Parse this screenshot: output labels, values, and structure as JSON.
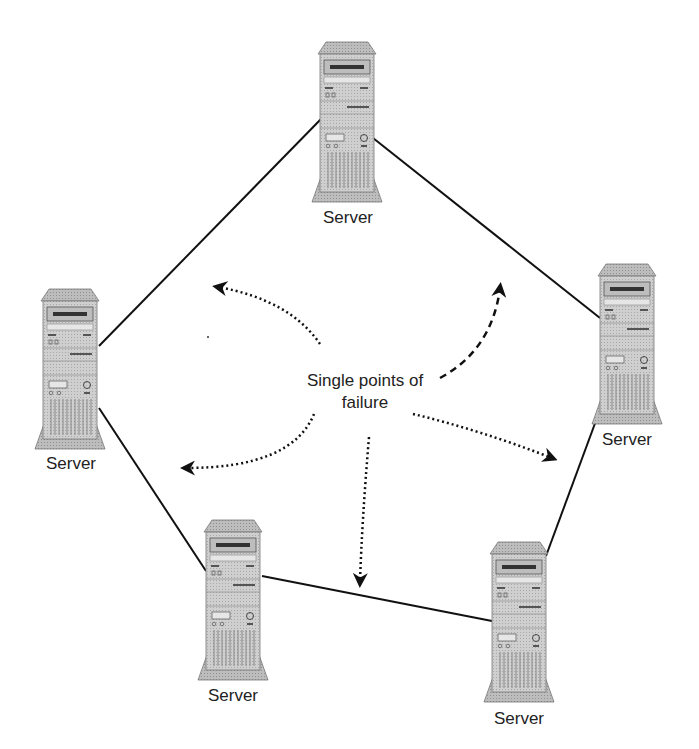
{
  "center_label": {
    "line1": "Single points of",
    "line2": "failure"
  },
  "servers": [
    {
      "id": "top",
      "label": "Server"
    },
    {
      "id": "right",
      "label": "Server"
    },
    {
      "id": "bottom-right",
      "label": "Server"
    },
    {
      "id": "bottom-left",
      "label": "Server"
    },
    {
      "id": "left",
      "label": "Server"
    }
  ],
  "links": [
    {
      "from": "top",
      "to": "right",
      "style": "solid"
    },
    {
      "from": "right",
      "to": "bottom-right",
      "style": "solid"
    },
    {
      "from": "bottom-right",
      "to": "bottom-left",
      "style": "solid"
    },
    {
      "from": "bottom-left",
      "to": "left",
      "style": "solid"
    },
    {
      "from": "left",
      "to": "top",
      "style": "solid"
    }
  ],
  "arrows": [
    {
      "id": "upper-left",
      "style": "dotted"
    },
    {
      "id": "upper-right",
      "style": "dashed"
    },
    {
      "id": "right",
      "style": "dotted"
    },
    {
      "id": "down",
      "style": "dotted"
    },
    {
      "id": "lower-left",
      "style": "dotted"
    }
  ],
  "colors": {
    "line": "#111111",
    "server_body": "#c8c8c8",
    "server_dark": "#8a8a8a",
    "background": "#ffffff"
  }
}
